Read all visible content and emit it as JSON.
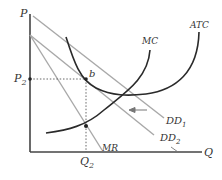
{
  "diagram": {
    "type": "economics-monopolistic-competition",
    "axes": {
      "y_label": "P",
      "x_label": "Q"
    },
    "price_label": {
      "main": "P",
      "sub": "2"
    },
    "quantity_label": {
      "main": "Q",
      "sub": "2"
    },
    "point_label": "b",
    "curves": {
      "mc": "MC",
      "atc": "ATC",
      "mr": "MR",
      "dd1": {
        "main": "DD",
        "sub": "1"
      },
      "dd2": {
        "main": "DD",
        "sub": "2"
      }
    },
    "colors": {
      "axis": "#444444",
      "cost_curves": "#2a2a2a",
      "demand_lines": "#a8a8a8",
      "guides": "#555555"
    }
  }
}
